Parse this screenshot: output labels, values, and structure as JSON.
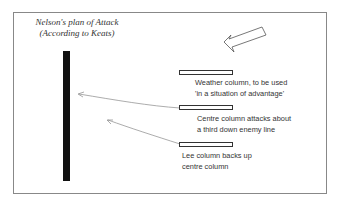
{
  "title": {
    "line1": "Nelson's plan of Attack",
    "line2": "(According to Keats)"
  },
  "columns": [
    {
      "name": "weather",
      "line1": "Weather column, to be used",
      "line2": "'in a situation of advantage'"
    },
    {
      "name": "centre",
      "line1": "Centre column attacks about",
      "line2": "a third down enemy line"
    },
    {
      "name": "lee",
      "line1": "Lee column backs up",
      "line2": "centre column"
    }
  ],
  "icons": {
    "wind_arrow": "large-hollow-arrow-pointing-down-left",
    "enemy_line": "black-vertical-bar"
  }
}
